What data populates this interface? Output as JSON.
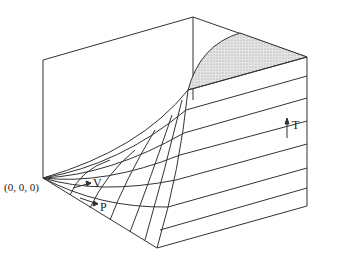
{
  "diagram": {
    "type": "3d-surface",
    "labels": {
      "origin": "(0, 0, 0)",
      "v_axis": "V",
      "p_axis": "P",
      "t_axis": "T"
    },
    "colors": {
      "line": "#333333",
      "shaded_region": "#d8d8d8",
      "background": "#ffffff"
    }
  }
}
